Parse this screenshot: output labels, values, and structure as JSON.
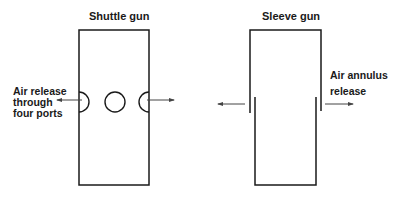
{
  "diagram": {
    "shuttle_gun": {
      "title": "Shuttle gun",
      "annotation_lines": [
        "Air release",
        "through",
        "four ports"
      ],
      "ports": [
        "left-half-port",
        "center-port",
        "right-half-port"
      ]
    },
    "sleeve_gun": {
      "title": "Sleeve gun",
      "annotation_lines": [
        "Air annulus",
        "release"
      ]
    },
    "colors": {
      "line": "#1a1a1a",
      "arrow": "#444444",
      "background": "#ffffff"
    }
  }
}
